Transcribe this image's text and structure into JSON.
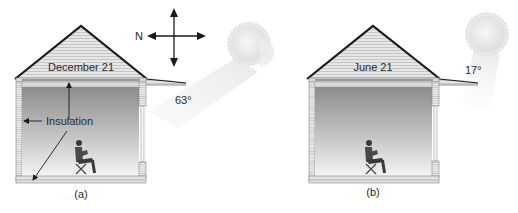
{
  "figure": {
    "panels": [
      {
        "id": "a",
        "caption": "(a)",
        "date_label": "December 21",
        "sun_angle": "63°",
        "insulation_label": "Insulation"
      },
      {
        "id": "b",
        "caption": "(b)",
        "date_label": "June 21",
        "sun_angle": "17°"
      }
    ],
    "compass": {
      "north_label": "N"
    }
  },
  "colors": {
    "roof_line": "#1a1a1a",
    "siding": "#e4e4e4",
    "siding_line": "#b5b5b5",
    "interior_top": "#8f8f8f",
    "interior_bottom": "#f2f2f2",
    "sun": "#e6e6e6",
    "beam": "#efefef"
  }
}
